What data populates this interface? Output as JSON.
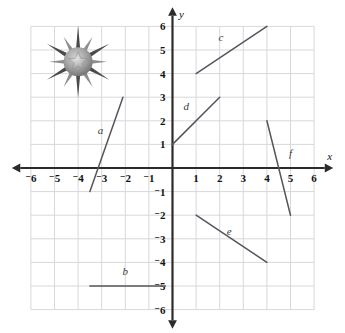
{
  "chart_data": {
    "type": "line",
    "title": "",
    "xlabel": "x",
    "ylabel": "y",
    "xlim": [
      -6.5,
      6.5
    ],
    "ylim": [
      -6.5,
      6.5
    ],
    "grid": true,
    "legend": "none",
    "x_ticks": [
      "⁻6",
      "⁻5",
      "⁻4",
      "⁻3",
      "⁻2",
      "⁻1",
      "1",
      "2",
      "3",
      "4",
      "5",
      "6"
    ],
    "x_tick_values": [
      -6,
      -5,
      -4,
      -3,
      -2,
      -1,
      1,
      2,
      3,
      4,
      5,
      6
    ],
    "y_ticks": [
      "6",
      "5",
      "4",
      "3",
      "2",
      "1",
      "⁻1",
      "⁻2",
      "⁻3",
      "⁻4",
      "⁻5",
      "⁻6"
    ],
    "y_tick_values": [
      6,
      5,
      4,
      3,
      2,
      1,
      -1,
      -2,
      -3,
      -4,
      -5,
      -6
    ],
    "series": [
      {
        "name": "a",
        "label": "a",
        "x": [
          -3.5,
          -2.1
        ],
        "y": [
          -1,
          3
        ],
        "label_x": -3.05,
        "label_y": 1.45
      },
      {
        "name": "b",
        "label": "b",
        "x": [
          -3.5,
          -0.3
        ],
        "y": [
          -5,
          -5
        ],
        "label_x": -2.0,
        "label_y": -4.55
      },
      {
        "name": "c",
        "label": "c",
        "x": [
          1,
          4
        ],
        "y": [
          4,
          6
        ],
        "label_x": 2.05,
        "label_y": 5.4
      },
      {
        "name": "d",
        "label": "d",
        "x": [
          0,
          2
        ],
        "y": [
          1,
          3
        ],
        "label_x": 0.58,
        "label_y": 2.45
      },
      {
        "name": "e",
        "label": "e",
        "x": [
          1,
          4
        ],
        "y": [
          -2,
          -4
        ],
        "label_x": 2.4,
        "label_y": -2.85
      },
      {
        "name": "f",
        "label": "f",
        "x": [
          4,
          5
        ],
        "y": [
          2,
          -2
        ],
        "label_x": 5.0,
        "label_y": 0.45
      }
    ],
    "annotations": [
      {
        "name": "starburst-decoration",
        "x": -4.0,
        "y": 4.5,
        "description": "decorative grayscale starburst medal with five-pointed star"
      }
    ]
  },
  "axes": {
    "x_axis_label": "x",
    "y_axis_label": "y"
  },
  "colors": {
    "grid": "#d8d8dc",
    "axis": "#2b2b2b",
    "segment": "#55555c",
    "text": "#111111",
    "star_dark": "#4a4a4a",
    "star_mid": "#8e8e8e",
    "star_light": "#c9c9c9"
  }
}
